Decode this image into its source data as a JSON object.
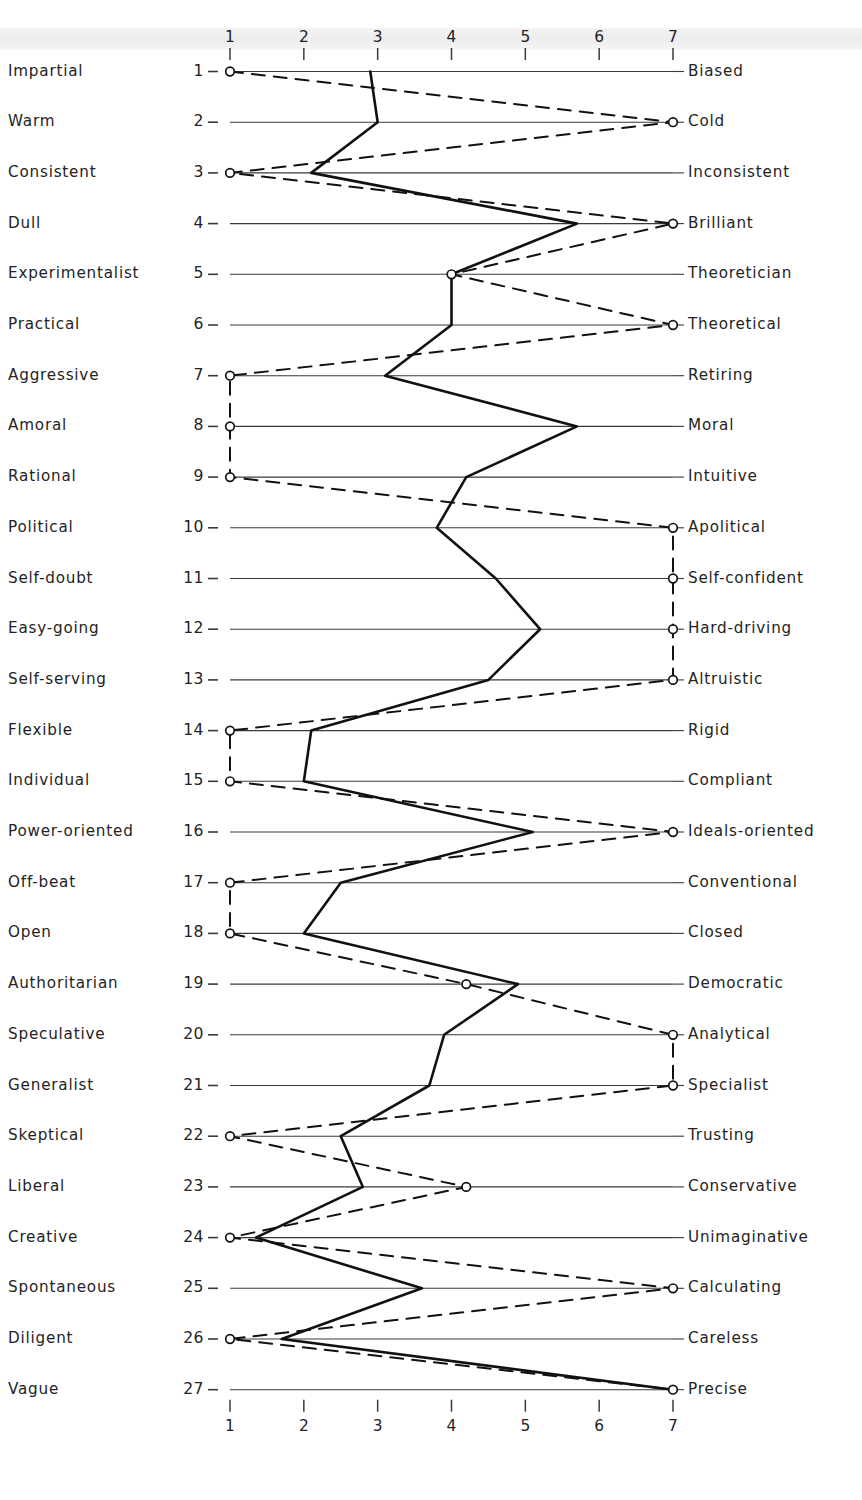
{
  "chart_data": {
    "type": "line",
    "title": "",
    "xlabel": "",
    "ylabel": "",
    "xlim": [
      1,
      7
    ],
    "grid": false,
    "legend": "none",
    "axis_ticks": [
      "1",
      "2",
      "3",
      "4",
      "5",
      "6",
      "7"
    ],
    "axis_top": [
      "1",
      "2",
      "3",
      "4",
      "5",
      "6",
      "7"
    ],
    "axis_bottom": [
      "1",
      "2",
      "3",
      "4",
      "5",
      "6",
      "7"
    ],
    "row_numbers": [
      "1",
      "2",
      "3",
      "4",
      "5",
      "6",
      "7",
      "8",
      "9",
      "10",
      "11",
      "12",
      "13",
      "14",
      "15",
      "16",
      "17",
      "18",
      "19",
      "20",
      "21",
      "22",
      "23",
      "24",
      "25",
      "26",
      "27"
    ],
    "left_labels": [
      "Impartial",
      "Warm",
      "Consistent",
      "Dull",
      "Experimentalist",
      "Practical",
      "Aggressive",
      "Amoral",
      "Rational",
      "Political",
      "Self-doubt",
      "Easy-going",
      "Self-serving",
      "Flexible",
      "Individual",
      "Power-oriented",
      "Off-beat",
      "Open",
      "Authoritarian",
      "Speculative",
      "Generalist",
      "Skeptical",
      "Liberal",
      "Creative",
      "Spontaneous",
      "Diligent",
      "Vague"
    ],
    "right_labels": [
      "Biased",
      "Cold",
      "Inconsistent",
      "Brilliant",
      "Theoretician",
      "Theoretical",
      "Retiring",
      "Moral",
      "Intuitive",
      "Apolitical",
      "Self-confident",
      "Hard-driving",
      "Altruistic",
      "Rigid",
      "Compliant",
      "Ideals-oriented",
      "Conventional",
      "Closed",
      "Democratic",
      "Analytical",
      "Specialist",
      "Trusting",
      "Conservative",
      "Unimaginative",
      "Calculating",
      "Careless",
      "Precise"
    ],
    "series": [
      {
        "name": "solid-profile",
        "style": "solid",
        "values": [
          2.9,
          3.0,
          2.1,
          5.7,
          4.0,
          4.0,
          3.1,
          5.7,
          4.2,
          3.8,
          4.6,
          5.2,
          4.5,
          2.1,
          2.0,
          5.1,
          2.5,
          2.0,
          4.9,
          3.9,
          3.7,
          2.5,
          2.8,
          1.35,
          3.6,
          1.7,
          7.0
        ]
      },
      {
        "name": "dashed-profile",
        "style": "dashed",
        "values": [
          1.0,
          7.0,
          1.0,
          7.0,
          4.0,
          7.0,
          1.0,
          1.0,
          1.0,
          7.0,
          7.0,
          7.0,
          7.0,
          1.0,
          1.0,
          7.0,
          1.0,
          1.0,
          4.2,
          7.0,
          7.0,
          1.0,
          4.2,
          1.0,
          7.0,
          1.0,
          7.0
        ]
      }
    ],
    "markers": {
      "note": "open circles mark the dashed-profile endpoints at the scale extremes",
      "shape": "open-circle"
    },
    "colors": {
      "line": "#111111",
      "rule": "#3a3a3a",
      "text": "#232323",
      "background": "#ffffff"
    }
  }
}
